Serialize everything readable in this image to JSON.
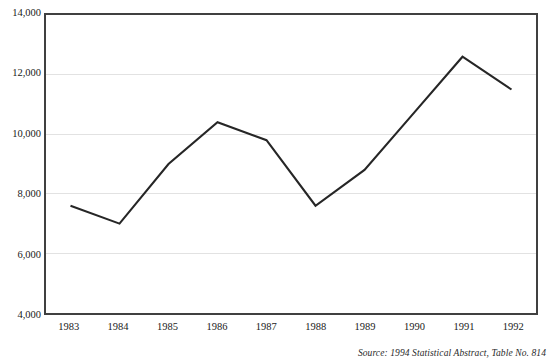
{
  "chart_data": {
    "type": "line",
    "title": "",
    "xlabel": "",
    "ylabel": "",
    "x": [
      "1983",
      "1984",
      "1985",
      "1986",
      "1987",
      "1988",
      "1989",
      "1990",
      "1991",
      "1992"
    ],
    "categories": [
      "1983",
      "1984",
      "1985",
      "1986",
      "1987",
      "1988",
      "1989",
      "1990",
      "1991",
      "1992"
    ],
    "values": [
      7600,
      7000,
      9000,
      10400,
      9800,
      7600,
      8800,
      10700,
      12600,
      11500
    ],
    "series": [
      {
        "name": "",
        "values": [
          7600,
          7000,
          9000,
          10400,
          9800,
          7600,
          8800,
          10700,
          12600,
          11500
        ]
      }
    ],
    "ylim": [
      4000,
      14000
    ],
    "yticks": [
      4000,
      6000,
      8000,
      10000,
      12000,
      14000
    ],
    "ytick_labels": [
      "4,000",
      "6,000",
      "8,000",
      "10,000",
      "12,000",
      "14,000"
    ],
    "grid": true,
    "grid_axis": "y",
    "legend": false,
    "legend_position": "none",
    "line_color": "#262626",
    "grid_color": "#e2e2e2",
    "frame_color": "#404040",
    "markers": false
  },
  "source": {
    "text": "Source: 1994 Statistical Abstract, Table No. 814"
  },
  "header": {
    "title_clipped": ""
  }
}
